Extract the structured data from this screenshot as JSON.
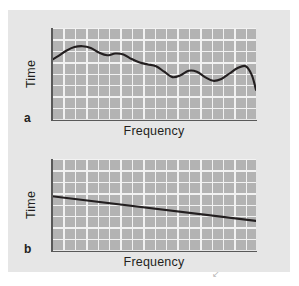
{
  "figure": {
    "background_color": "#ffffff",
    "panel_color": "#e6e6e6",
    "plot_area_color": "#b3b3b3",
    "grid_color": "#f2f2f2",
    "line_color": "#231f20",
    "axis_color": "#595959",
    "stray_mark": "↙"
  },
  "chart_data": [
    {
      "type": "line",
      "panel_label": "a",
      "title": "",
      "xlabel": "Frequency",
      "ylabel": "Time",
      "xlim": [
        0,
        100
      ],
      "ylim": [
        0,
        100
      ],
      "grid": true,
      "xticks": [],
      "yticks": [],
      "legend": false,
      "series": [
        {
          "name": "Time vs Frequency (irregular / noisy decline)",
          "x": [
            0,
            3,
            7,
            11,
            15,
            19,
            23,
            27,
            31,
            35,
            39,
            43,
            47,
            51,
            55,
            59,
            63,
            67,
            71,
            75,
            79,
            83,
            87,
            91,
            95,
            98,
            100
          ],
          "y": [
            65,
            69,
            75,
            79,
            80,
            78,
            73,
            70,
            72,
            71,
            66,
            62,
            60,
            58,
            52,
            46,
            48,
            53,
            52,
            46,
            42,
            44,
            50,
            56,
            58,
            48,
            32
          ]
        }
      ]
    },
    {
      "type": "line",
      "panel_label": "b",
      "title": "",
      "xlabel": "Frequency",
      "ylabel": "Time",
      "xlim": [
        0,
        100
      ],
      "ylim": [
        0,
        100
      ],
      "grid": true,
      "xticks": [],
      "yticks": [],
      "legend": false,
      "series": [
        {
          "name": "Time vs Frequency (linear decline)",
          "x": [
            0,
            100
          ],
          "y": [
            59,
            32
          ]
        }
      ]
    }
  ]
}
